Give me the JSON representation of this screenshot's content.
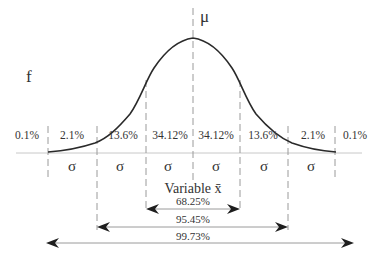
{
  "diagram": {
    "mean_label": "μ",
    "y_axis_label": "f",
    "x_axis_label": "Variable x̄",
    "sigma_label": "σ",
    "region_percentages": [
      "0.1%",
      "2.1%",
      "13.6%",
      "34.12%",
      "34.12%",
      "13.6%",
      "2.1%",
      "0.1%"
    ],
    "sigma_segments": [
      "σ",
      "σ",
      "σ",
      "σ",
      "σ",
      "σ"
    ],
    "ranges": [
      {
        "label": "68.25%",
        "span": "±1σ"
      },
      {
        "label": "95.45%",
        "span": "±2σ"
      },
      {
        "label": "99.73%",
        "span": "±3σ"
      }
    ],
    "colors": {
      "curve": "#2a2a2a",
      "dashed_lines": "#9a9a9a",
      "baseline": "#c8c8c8",
      "arrows": "#1e1e1e",
      "text": "#333333"
    }
  }
}
